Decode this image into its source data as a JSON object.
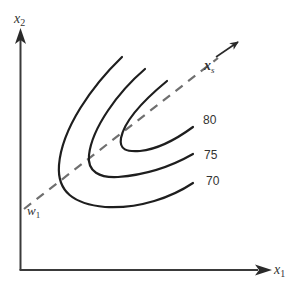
{
  "diagram": {
    "axes": {
      "x_label": "x",
      "x_sub": "1",
      "y_label": "x",
      "y_sub": "2"
    },
    "direction": {
      "label": "x",
      "sub": "s",
      "origin_label": "w",
      "origin_sub": "1"
    },
    "contours": [
      {
        "level": "80"
      },
      {
        "level": "75"
      },
      {
        "level": "70"
      }
    ],
    "colors": {
      "curve": "#1e1e1e",
      "dashed": "#6f6f6f",
      "axis": "#3a3a3a"
    }
  }
}
